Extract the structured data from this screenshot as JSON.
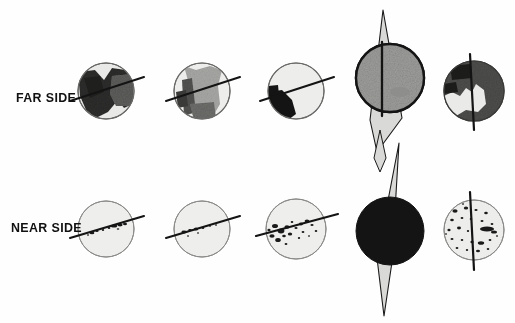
{
  "figure": {
    "type": "diagram",
    "background_color": "#fefefe",
    "ink_color": "#111111"
  },
  "labels": {
    "far_side": "FAR SIDE",
    "near_side": "NEAR SIDE"
  },
  "palette": {
    "outline": "#1a1a1a",
    "light_surface": "#e8e8e6",
    "mid_gray": "#9a9a98",
    "dark_gray": "#5a5a58",
    "black_fill": "#141414",
    "spindle_fill": "#d8d8d6",
    "speckle": "#1a1a1a"
  },
  "columns": [
    {
      "index": 1,
      "axis": "tilted",
      "axis_angle_deg": -18
    },
    {
      "index": 2,
      "axis": "tilted",
      "axis_angle_deg": -18
    },
    {
      "index": 3,
      "axis": "tilted",
      "axis_angle_deg": -18
    },
    {
      "index": 4,
      "axis": "vertical",
      "axis_angle_deg": 0,
      "has_spindle": true
    },
    {
      "index": 5,
      "axis": "vertical",
      "axis_angle_deg": 0,
      "has_spindle": true
    }
  ],
  "rows": [
    {
      "name": "FAR SIDE",
      "globes": [
        {
          "column": 1,
          "cx": 106,
          "cy": 91,
          "r": 28,
          "base": "light_surface",
          "feature": "large-dark-mare-band",
          "feature_tone": "#2b2b29"
        },
        {
          "column": 2,
          "cx": 202,
          "cy": 91,
          "r": 28,
          "base": "light_surface",
          "feature": "broad-mid-gray-band",
          "feature_tone": "#8e8e8c"
        },
        {
          "column": 3,
          "cx": 296,
          "cy": 91,
          "r": 28,
          "base": "light_surface",
          "feature": "small-black-crescent-lower-left",
          "feature_tone": "#141414"
        },
        {
          "column": 4,
          "cx": 390,
          "cy": 78,
          "r": 34,
          "base": "mid_gray",
          "feature": "uniform-textured-disc",
          "feature_tone": "#9a9a98"
        },
        {
          "column": 5,
          "cx": 474,
          "cy": 91,
          "r": 30,
          "base": "dark_gray",
          "feature": "dark-disc-with-light-patch",
          "feature_tone": "#4a4a48"
        }
      ]
    },
    {
      "name": "NEAR SIDE",
      "globes": [
        {
          "column": 1,
          "cx": 106,
          "cy": 229,
          "r": 28,
          "base": "light_surface",
          "feature": "few-small-dark-speckles",
          "speckle_count": 9
        },
        {
          "column": 2,
          "cx": 202,
          "cy": 229,
          "r": 28,
          "base": "light_surface",
          "feature": "few-small-dark-speckles",
          "speckle_count": 8
        },
        {
          "column": 3,
          "cx": 296,
          "cy": 229,
          "r": 30,
          "base": "light_surface",
          "feature": "clustered-dark-speckles-left",
          "speckle_count": 18
        },
        {
          "column": 4,
          "cx": 390,
          "cy": 231,
          "r": 34,
          "base": "black_fill",
          "feature": "solid-black-disc"
        },
        {
          "column": 5,
          "cx": 474,
          "cy": 230,
          "r": 30,
          "base": "light_surface",
          "feature": "many-scattered-dark-speckles",
          "speckle_count": 26
        }
      ]
    }
  ],
  "spindles": [
    {
      "column": 4,
      "orientation": "near-vertical",
      "top_y": 8,
      "bottom_y": 152,
      "note": "upper elongated lens behind far-side globe"
    },
    {
      "column": 4,
      "orientation": "near-vertical",
      "top_y": 140,
      "bottom_y": 316,
      "note": "lower elongated lens behind near-side globe"
    }
  ]
}
